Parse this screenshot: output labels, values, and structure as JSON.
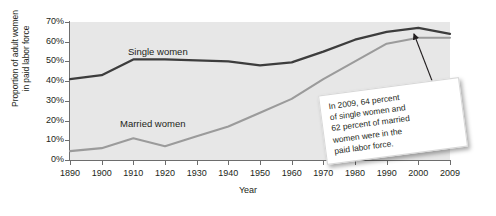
{
  "chart_data": {
    "type": "line",
    "title": "",
    "subtitle": "",
    "xlabel": "Year",
    "ylabel": "Proportion of adult women in paid labor force",
    "ylabel_line1": "Proportion of adult women",
    "ylabel_line2": "in paid labor force",
    "x": [
      1890,
      1900,
      1910,
      1920,
      1930,
      1940,
      1950,
      1960,
      1970,
      1980,
      1990,
      2000,
      2009
    ],
    "categories": [
      "1890",
      "1900",
      "1910",
      "1920",
      "1930",
      "1940",
      "1950",
      "1960",
      "1970",
      "1980",
      "1990",
      "2000",
      "2009"
    ],
    "xtick_labels": [
      "1890",
      "1900",
      "1910",
      "1920",
      "1930",
      "1940",
      "1950",
      "1960",
      "1970",
      "1980",
      "1990",
      "2000",
      "2009"
    ],
    "ytick_labels": [
      "0%",
      "10%",
      "20%",
      "30%",
      "40%",
      "50%",
      "60%",
      "70%"
    ],
    "ytick_values": [
      0,
      10,
      20,
      30,
      40,
      50,
      60,
      70
    ],
    "xlim": [
      1890,
      2009
    ],
    "ylim": [
      0,
      70
    ],
    "grid": false,
    "legend_position": "inline-labels",
    "series": [
      {
        "name": "Single women",
        "color": "#3d3d3d",
        "values": [
          41,
          43,
          51,
          51,
          50.5,
          50,
          48,
          49.5,
          55,
          61,
          65,
          67,
          64
        ]
      },
      {
        "name": "Married women",
        "color": "#9b9b9b",
        "values": [
          4.5,
          6,
          11,
          7,
          12,
          17,
          24,
          31,
          41,
          50,
          59,
          62,
          62
        ]
      }
    ],
    "annotations": [
      {
        "name": "callout-2009",
        "text": "In 2009, 64 percent of single women and 62 percent of married women were in the paid labor force.",
        "lines": [
          "In 2009, 64 percent",
          "of single women and",
          "62 percent of married",
          "women were in the",
          "paid labor force."
        ],
        "points_to_year": 2009
      }
    ]
  },
  "colors": {
    "plot_background": "#e7e7e7",
    "page_background": "#ffffff",
    "axis": "#6d6d6d",
    "text": "#231f20",
    "single_women": "#3d3d3d",
    "married_women": "#9b9b9b",
    "callout_background": "#ffffff"
  }
}
